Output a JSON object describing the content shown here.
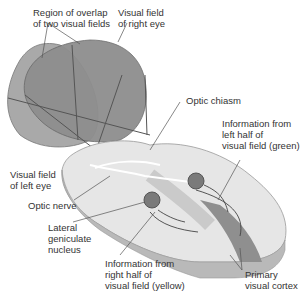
{
  "diagram": {
    "labels": {
      "overlap": "Region of overlap\nof two visual fields",
      "right_field": "Visual field\nof right eye",
      "left_field": "Visual field\nof left eye",
      "chiasm": "Optic chiasm",
      "left_half": "Information from\nleft half of\nvisual field (green)",
      "optic_nerve": "Optic nerve",
      "lgn": "Lateral\ngeniculate\nnucleus",
      "right_half": "Information from\nright half of\nvisual field (yellow)",
      "cortex": "Primary\nvisual cortex"
    },
    "colors": {
      "left_field": "#a8a8a8",
      "right_field": "#8c8c8c",
      "brain_light": "#e8e8e8",
      "brain_mid": "#c4c4c4",
      "brain_dark": "#9a9a9a",
      "nucleus": "#7a7a7a"
    }
  }
}
